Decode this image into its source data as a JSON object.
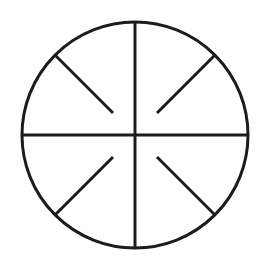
{
  "diagram": {
    "type": "wheel-symbol",
    "stroke_color": "#1c1c1c",
    "background_color": "#ffffff",
    "stroke_width": 3,
    "circle": {
      "cx": 135,
      "cy": 135,
      "r": 113
    },
    "axes": [
      {
        "name": "vertical-diameter",
        "x1": 135,
        "y1": 22,
        "x2": 135,
        "y2": 248
      },
      {
        "name": "horizontal-diameter",
        "x1": 22,
        "y1": 135,
        "x2": 248,
        "y2": 135
      }
    ],
    "spokes": [
      {
        "name": "spoke-top-left",
        "x1": 55,
        "y1": 55,
        "x2": 113,
        "y2": 113
      },
      {
        "name": "spoke-top-right",
        "x1": 215,
        "y1": 55,
        "x2": 157,
        "y2": 113
      },
      {
        "name": "spoke-bottom-left",
        "x1": 55,
        "y1": 215,
        "x2": 113,
        "y2": 157
      },
      {
        "name": "spoke-bottom-right",
        "x1": 215,
        "y1": 215,
        "x2": 157,
        "y2": 157
      }
    ]
  }
}
